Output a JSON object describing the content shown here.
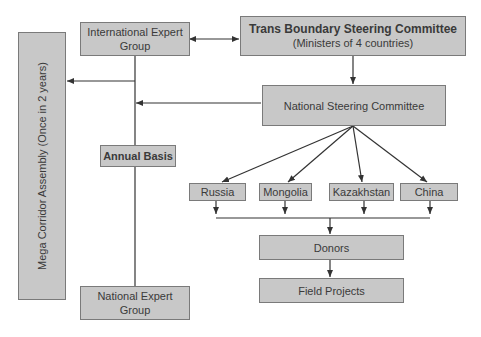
{
  "diagram": {
    "nodes": {
      "mega_corridor": "Mega Corridor Assembly (Once in 2 years)",
      "intl_expert_line1": "International Expert",
      "intl_expert_line2": "Group",
      "trans_boundary_title": "Trans Boundary Steering Committee",
      "trans_boundary_sub": "(Ministers of 4 countries)",
      "national_steering": "National Steering Committee",
      "annual_basis": "Annual Basis",
      "russia": "Russia",
      "mongolia": "Mongolia",
      "kazakhstan": "Kazakhstan",
      "china": "China",
      "donors": "Donors",
      "field_projects": "Field Projects",
      "national_expert_line1": "National Expert",
      "national_expert_line2": "Group"
    },
    "edges": [
      {
        "from": "International Expert Group",
        "to": "Trans Boundary Steering Committee",
        "type": "bidirectional"
      },
      {
        "from": "Trans Boundary Steering Committee",
        "to": "National Steering Committee"
      },
      {
        "from": "Expert Group line",
        "to": "Mega Corridor Assembly"
      },
      {
        "from": "National Steering Committee",
        "to": "Expert Group line"
      },
      {
        "from": "National Steering Committee",
        "to": "Russia"
      },
      {
        "from": "National Steering Committee",
        "to": "Mongolia"
      },
      {
        "from": "National Steering Committee",
        "to": "Kazakhstan"
      },
      {
        "from": "National Steering Committee",
        "to": "China"
      },
      {
        "from": "Russia/Mongolia/Kazakhstan/China",
        "to": "Donors"
      },
      {
        "from": "Donors",
        "to": "Field Projects"
      },
      {
        "from": "International Expert Group",
        "to": "National Expert Group",
        "label": "Annual Basis"
      }
    ],
    "colors": {
      "box_fill": "#c8c8c8",
      "box_border": "#7a7a7a",
      "line": "#333333"
    }
  }
}
